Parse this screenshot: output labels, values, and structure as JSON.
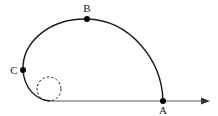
{
  "diagram": {
    "points": [
      {
        "id": "A",
        "label": "A"
      },
      {
        "id": "B",
        "label": "B"
      },
      {
        "id": "C",
        "label": "C"
      }
    ],
    "colors": {
      "curve": "#1a1a1a",
      "axis": "#555555",
      "dot": "#000000"
    }
  }
}
